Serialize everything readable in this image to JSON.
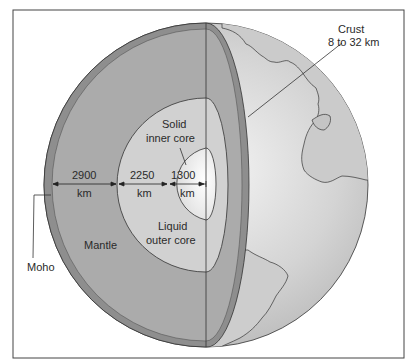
{
  "figure": {
    "colors": {
      "frame": "#444444",
      "mantle": "#a9a9a9",
      "crust_band": "#8c8c8c",
      "outer_core": "#cfcfcf",
      "inner_core": "#eeeeee",
      "globe_surface": "#d6d6d6",
      "line": "#333333"
    },
    "labels": {
      "crust_title": "Crust",
      "crust_range": "8 to 32 km",
      "inner_core_line1": "Solid",
      "inner_core_line2": "inner core",
      "outer_core_line1": "Liquid",
      "outer_core_line2": "outer core",
      "mantle": "Mantle",
      "moho": "Moho"
    },
    "dimensions": [
      {
        "value": "2900",
        "unit": "km",
        "layer": "mantle"
      },
      {
        "value": "2250",
        "unit": "km",
        "layer": "outer core"
      },
      {
        "value": "1300",
        "unit": "km",
        "layer": "inner core"
      }
    ]
  }
}
